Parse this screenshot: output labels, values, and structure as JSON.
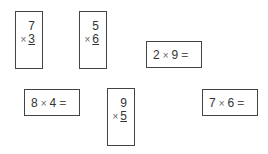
{
  "problems": [
    {
      "format": "vertical",
      "a": "7",
      "b": "3",
      "op": "×"
    },
    {
      "format": "vertical",
      "a": "5",
      "b": "6",
      "op": "×"
    },
    {
      "format": "horizontal",
      "a": "2",
      "b": "9",
      "op": "×",
      "eq": "="
    },
    {
      "format": "horizontal",
      "a": "8",
      "b": "4",
      "op": "×",
      "eq": "="
    },
    {
      "format": "vertical",
      "a": "9",
      "b": "5",
      "op": "×"
    },
    {
      "format": "horizontal",
      "a": "7",
      "b": "6",
      "op": "×",
      "eq": "="
    }
  ]
}
